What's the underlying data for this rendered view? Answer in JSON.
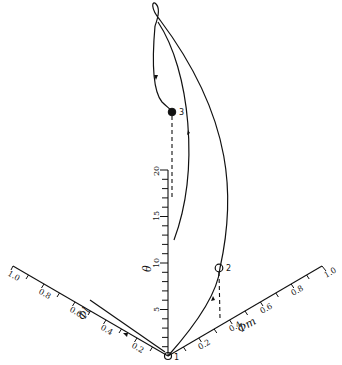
{
  "figure": {
    "theta_axis": {
      "name": "θ",
      "ticks": [
        "5",
        "10",
        "15",
        "20"
      ]
    },
    "phi_left_axis": {
      "name": "Φl",
      "ticks": [
        "0.2",
        "0.4",
        "0.6",
        "0.8",
        "1.0"
      ]
    },
    "phi_right_axis": {
      "name": "Φm",
      "ticks": [
        "0.2",
        "0.4",
        "0.6",
        "0.8",
        "1.0"
      ]
    },
    "points": [
      {
        "id": "1",
        "label": "1"
      },
      {
        "id": "2",
        "label": "2"
      },
      {
        "id": "3",
        "label": "3"
      }
    ]
  }
}
